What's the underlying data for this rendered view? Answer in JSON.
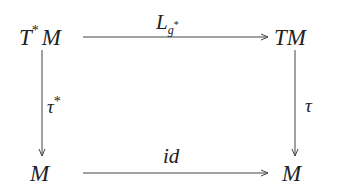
{
  "diagram": {
    "type": "commutative-diagram",
    "nodes": {
      "top_left": {
        "base": "T",
        "sup": "*",
        "tail": "M"
      },
      "top_right": {
        "text": "TM"
      },
      "bottom_left": {
        "text": "M"
      },
      "bottom_right": {
        "text": "M"
      }
    },
    "arrows": {
      "top": {
        "label_main": "L",
        "label_sub": "g",
        "label_sup": "*",
        "from": "T*M",
        "to": "TM"
      },
      "bottom": {
        "label": "id",
        "from": "M",
        "to": "M"
      },
      "left": {
        "label_main": "τ",
        "label_sup": "*",
        "from": "T*M",
        "to": "M"
      },
      "right": {
        "label": "τ",
        "from": "TM",
        "to": "M"
      }
    },
    "colors": {
      "line": "#444444",
      "text": "#222222",
      "background": "#ffffff"
    }
  }
}
